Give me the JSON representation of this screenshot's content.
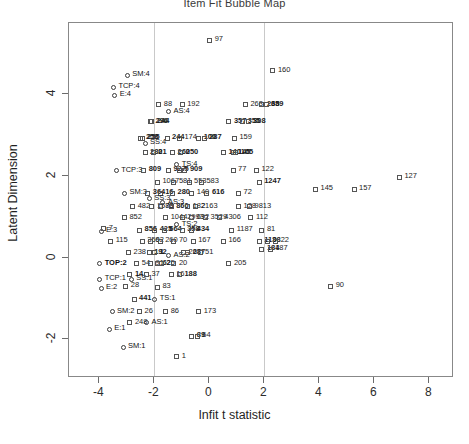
{
  "chart_data": {
    "type": "scatter",
    "title": "Item Fit Bubble Map",
    "xlabel": "Infit t statistic",
    "ylabel": "Latent Dimension",
    "footnote": "",
    "xlim": [
      -5.1,
      8.9
    ],
    "ylim": [
      -2.95,
      5.75
    ],
    "xticks": [
      -4,
      -2,
      0,
      2,
      4,
      6,
      8
    ],
    "yticks": [
      -2,
      0,
      2,
      4
    ],
    "grid": false,
    "vlines": [
      -2,
      2
    ],
    "legend": "none",
    "point_color": "#555555",
    "vline_color": "#c9c9c9",
    "frame_color": "#888888",
    "points": [
      {
        "label": "97",
        "x": 0.05,
        "y": 5.3,
        "shape": "square"
      },
      {
        "label": "160",
        "x": 2.35,
        "y": 4.55,
        "shape": "square"
      },
      {
        "label": "SM:4",
        "x": -2.95,
        "y": 4.45,
        "shape": "circle",
        "anchor": true
      },
      {
        "label": "TCP:4",
        "x": -3.45,
        "y": 4.15,
        "shape": "circle",
        "anchor": true
      },
      {
        "label": "E:4",
        "x": -3.4,
        "y": 3.95,
        "shape": "circle",
        "anchor": true
      },
      {
        "label": "88",
        "x": -1.8,
        "y": 3.72,
        "shape": "square"
      },
      {
        "label": "192",
        "x": -0.95,
        "y": 3.72,
        "shape": "square"
      },
      {
        "label": "AS:4",
        "x": -1.45,
        "y": 3.55,
        "shape": "circle",
        "anchor": true
      },
      {
        "label": "263",
        "x": 1.35,
        "y": 3.72,
        "shape": "square"
      },
      {
        "label": "268",
        "x": 1.95,
        "y": 3.72,
        "shape": "square",
        "bold": true
      },
      {
        "label": "359",
        "x": 2.1,
        "y": 3.72,
        "shape": "square",
        "bold": true
      },
      {
        "label": "296",
        "x": -2.1,
        "y": 3.3,
        "shape": "square",
        "bold": true
      },
      {
        "label": "244",
        "x": -2.05,
        "y": 3.3,
        "shape": "square",
        "bold": true
      },
      {
        "label": "357",
        "x": 0.75,
        "y": 3.3,
        "shape": "square",
        "bold": true
      },
      {
        "label": "355",
        "x": 1.25,
        "y": 3.3,
        "shape": "square",
        "bold": true
      },
      {
        "label": "308",
        "x": 1.45,
        "y": 3.3,
        "shape": "square",
        "bold": true
      },
      {
        "label": "258",
        "x": -2.45,
        "y": 2.9,
        "shape": "square",
        "bold": true
      },
      {
        "label": "255",
        "x": -2.4,
        "y": 2.9,
        "shape": "square",
        "bold": true
      },
      {
        "label": "SS:4",
        "x": -2.3,
        "y": 2.78,
        "shape": "circle",
        "anchor": true
      },
      {
        "label": "244",
        "x": -1.5,
        "y": 2.9,
        "shape": "square",
        "bold": true
      },
      {
        "label": "174",
        "x": -1.05,
        "y": 2.9,
        "shape": "square"
      },
      {
        "label": "100",
        "x": -0.35,
        "y": 2.9,
        "shape": "square",
        "bold": true
      },
      {
        "label": "287",
        "x": -0.15,
        "y": 2.9,
        "shape": "square",
        "bold": true
      },
      {
        "label": "159",
        "x": 0.95,
        "y": 2.9,
        "shape": "square"
      },
      {
        "label": "280",
        "x": -2.3,
        "y": 2.55,
        "shape": "square",
        "bold": true
      },
      {
        "label": "21",
        "x": -2.0,
        "y": 2.55,
        "shape": "square",
        "bold": true
      },
      {
        "label": "260",
        "x": -1.3,
        "y": 2.55,
        "shape": "square",
        "bold": true
      },
      {
        "label": "250",
        "x": -1.0,
        "y": 2.55,
        "shape": "square",
        "bold": true
      },
      {
        "label": "140",
        "x": 0.55,
        "y": 2.55,
        "shape": "square",
        "bold": true
      },
      {
        "label": "145",
        "x": 0.9,
        "y": 2.55,
        "shape": "square",
        "bold": true
      },
      {
        "label": "165",
        "x": 1.0,
        "y": 2.55,
        "shape": "square",
        "bold": true
      },
      {
        "label": "TCP:3",
        "x": -3.35,
        "y": 2.1,
        "shape": "circle",
        "anchor": true
      },
      {
        "label": "809",
        "x": -2.35,
        "y": 2.12,
        "shape": "square",
        "bold": true
      },
      {
        "label": "927",
        "x": -1.45,
        "y": 2.12,
        "shape": "square",
        "bold": true
      },
      {
        "label": "TS:4",
        "x": -1.15,
        "y": 2.25,
        "shape": "circle",
        "anchor": true
      },
      {
        "label": "5",
        "x": -1.05,
        "y": 2.12,
        "shape": "square",
        "bold": true
      },
      {
        "label": "909",
        "x": -0.85,
        "y": 2.12,
        "shape": "square",
        "bold": true
      },
      {
        "label": "77",
        "x": 0.9,
        "y": 2.12,
        "shape": "square"
      },
      {
        "label": "122",
        "x": 1.75,
        "y": 2.12,
        "shape": "square"
      },
      {
        "label": "1067",
        "x": -1.85,
        "y": 1.82,
        "shape": "square"
      },
      {
        "label": "581",
        "x": -1.25,
        "y": 1.82,
        "shape": "square"
      },
      {
        "label": "553",
        "x": -0.7,
        "y": 1.82,
        "shape": "square"
      },
      {
        "label": "583",
        "x": -0.25,
        "y": 1.82,
        "shape": "square"
      },
      {
        "label": "1247",
        "x": 1.85,
        "y": 1.82,
        "shape": "square",
        "bold": true
      },
      {
        "label": "SM:3",
        "x": -3.05,
        "y": 1.55,
        "shape": "circle",
        "anchor": true
      },
      {
        "label": "364",
        "x": -2.2,
        "y": 1.55,
        "shape": "square",
        "bold": true
      },
      {
        "label": "16",
        "x": -1.75,
        "y": 1.55,
        "shape": "square",
        "bold": true
      },
      {
        "label": "280",
        "x": -1.3,
        "y": 1.55,
        "shape": "square",
        "bold": true
      },
      {
        "label": "140",
        "x": -0.6,
        "y": 1.55,
        "shape": "square"
      },
      {
        "label": "616",
        "x": -0.05,
        "y": 1.55,
        "shape": "square",
        "bold": true
      },
      {
        "label": "72",
        "x": 1.1,
        "y": 1.55,
        "shape": "square"
      },
      {
        "label": "SS:3",
        "x": -2.15,
        "y": 1.42,
        "shape": "circle",
        "anchor": true
      },
      {
        "label": "482",
        "x": -2.75,
        "y": 1.22,
        "shape": "square"
      },
      {
        "label": "1585",
        "x": -2.05,
        "y": 1.22,
        "shape": "square"
      },
      {
        "label": "78",
        "x": -1.75,
        "y": 1.22,
        "shape": "square"
      },
      {
        "label": "AS:3",
        "x": -1.65,
        "y": 1.32,
        "shape": "circle",
        "anchor": true
      },
      {
        "label": "860",
        "x": -1.35,
        "y": 1.22,
        "shape": "square",
        "bold": true
      },
      {
        "label": "182",
        "x": -0.75,
        "y": 1.22,
        "shape": "square"
      },
      {
        "label": "2163",
        "x": -0.45,
        "y": 1.22,
        "shape": "square"
      },
      {
        "label": "128",
        "x": 1.1,
        "y": 1.22,
        "shape": "square"
      },
      {
        "label": "9813",
        "x": 1.5,
        "y": 1.22,
        "shape": "square"
      },
      {
        "label": "852",
        "x": -3.05,
        "y": 0.95,
        "shape": "square"
      },
      {
        "label": "1044",
        "x": -1.55,
        "y": 0.95,
        "shape": "square"
      },
      {
        "label": "2993",
        "x": -0.95,
        "y": 0.95,
        "shape": "square"
      },
      {
        "label": "692",
        "x": -0.6,
        "y": 0.95,
        "shape": "square"
      },
      {
        "label": "3529",
        "x": -0.1,
        "y": 0.95,
        "shape": "square"
      },
      {
        "label": "4306",
        "x": 0.4,
        "y": 0.95,
        "shape": "square"
      },
      {
        "label": "112",
        "x": 1.55,
        "y": 0.95,
        "shape": "square"
      },
      {
        "label": "E:3",
        "x": -3.9,
        "y": 0.62,
        "shape": "circle",
        "anchor": true
      },
      {
        "label": "7",
        "x": -3.8,
        "y": 0.68,
        "shape": "square"
      },
      {
        "label": "856",
        "x": -2.5,
        "y": 0.65,
        "shape": "square",
        "bold": true
      },
      {
        "label": "425",
        "x": -1.95,
        "y": 0.65,
        "shape": "square",
        "bold": true
      },
      {
        "label": "664",
        "x": -1.6,
        "y": 0.65,
        "shape": "square",
        "bold": true
      },
      {
        "label": "TS:2",
        "x": -1.15,
        "y": 0.78,
        "shape": "circle",
        "anchor": true
      },
      {
        "label": "358",
        "x": -0.95,
        "y": 0.65,
        "shape": "square",
        "bold": true
      },
      {
        "label": "434",
        "x": -0.6,
        "y": 0.65,
        "shape": "square",
        "bold": true
      },
      {
        "label": "1187",
        "x": 0.85,
        "y": 0.65,
        "shape": "square"
      },
      {
        "label": "81",
        "x": 1.95,
        "y": 0.65,
        "shape": "square"
      },
      {
        "label": "115",
        "x": -3.55,
        "y": 0.38,
        "shape": "square"
      },
      {
        "label": "359",
        "x": -2.4,
        "y": 0.38,
        "shape": "square"
      },
      {
        "label": "62",
        "x": -2.1,
        "y": 0.38,
        "shape": "square"
      },
      {
        "label": "260",
        "x": -1.75,
        "y": 0.38,
        "shape": "square"
      },
      {
        "label": "70",
        "x": -1.25,
        "y": 0.38,
        "shape": "square"
      },
      {
        "label": "167",
        "x": -0.55,
        "y": 0.38,
        "shape": "square"
      },
      {
        "label": "166",
        "x": 0.55,
        "y": 0.38,
        "shape": "square"
      },
      {
        "label": "113",
        "x": 1.85,
        "y": 0.38,
        "shape": "square",
        "bold": true
      },
      {
        "label": "98",
        "x": 2.15,
        "y": 0.38,
        "shape": "square",
        "bold": true
      },
      {
        "label": "22",
        "x": 2.45,
        "y": 0.38,
        "shape": "square"
      },
      {
        "label": "184",
        "x": 1.95,
        "y": 0.18,
        "shape": "square",
        "bold": true
      },
      {
        "label": "187",
        "x": 2.25,
        "y": 0.18,
        "shape": "square"
      },
      {
        "label": "238",
        "x": -2.9,
        "y": 0.1,
        "shape": "square"
      },
      {
        "label": "192",
        "x": -2.15,
        "y": 0.1,
        "shape": "square",
        "bold": true
      },
      {
        "label": "1",
        "x": -1.95,
        "y": 0.1,
        "shape": "square",
        "bold": true
      },
      {
        "label": "AS:2",
        "x": -1.45,
        "y": 0.02,
        "shape": "circle",
        "anchor": true
      },
      {
        "label": "267",
        "x": -0.9,
        "y": 0.1,
        "shape": "square"
      },
      {
        "label": "287",
        "x": -0.75,
        "y": 0.1,
        "shape": "square",
        "bold": true
      },
      {
        "label": "51",
        "x": -0.3,
        "y": 0.1,
        "shape": "square"
      },
      {
        "label": "TOP:2",
        "x": -3.95,
        "y": -0.18,
        "shape": "circle",
        "anchor": true,
        "bold": true
      },
      {
        "label": "54",
        "x": -2.6,
        "y": -0.18,
        "shape": "square"
      },
      {
        "label": "91",
        "x": -2.1,
        "y": -0.18,
        "shape": "square"
      },
      {
        "label": "62",
        "x": -1.85,
        "y": -0.18,
        "shape": "square",
        "bold": true
      },
      {
        "label": "25",
        "x": -1.7,
        "y": -0.18,
        "shape": "square"
      },
      {
        "label": "20",
        "x": -1.25,
        "y": -0.18,
        "shape": "square"
      },
      {
        "label": "205",
        "x": 0.75,
        "y": -0.18,
        "shape": "square"
      },
      {
        "label": "TCP:1",
        "x": -3.95,
        "y": -0.55,
        "shape": "circle",
        "anchor": true
      },
      {
        "label": "14",
        "x": -2.85,
        "y": -0.45,
        "shape": "square",
        "bold": true
      },
      {
        "label": "SS:1",
        "x": -2.8,
        "y": -0.55,
        "shape": "circle",
        "anchor": true
      },
      {
        "label": "37",
        "x": -2.25,
        "y": -0.45,
        "shape": "square"
      },
      {
        "label": "16",
        "x": -1.35,
        "y": -0.45,
        "shape": "square"
      },
      {
        "label": "188",
        "x": -1.05,
        "y": -0.45,
        "shape": "square",
        "bold": true
      },
      {
        "label": "E:2",
        "x": -3.9,
        "y": -0.78,
        "shape": "circle",
        "anchor": true
      },
      {
        "label": "28",
        "x": -3.0,
        "y": -0.72,
        "shape": "square"
      },
      {
        "label": "83",
        "x": -1.85,
        "y": -0.75,
        "shape": "square"
      },
      {
        "label": "441",
        "x": -2.7,
        "y": -1.05,
        "shape": "square",
        "bold": true
      },
      {
        "label": "TS:1",
        "x": -1.95,
        "y": -1.05,
        "shape": "circle",
        "anchor": true
      },
      {
        "label": "SM:2",
        "x": -3.5,
        "y": -1.35,
        "shape": "circle",
        "anchor": true
      },
      {
        "label": "26",
        "x": -2.5,
        "y": -1.35,
        "shape": "square"
      },
      {
        "label": "86",
        "x": -1.55,
        "y": -1.35,
        "shape": "square"
      },
      {
        "label": "173",
        "x": -0.35,
        "y": -1.35,
        "shape": "square"
      },
      {
        "label": "248",
        "x": -2.85,
        "y": -1.62,
        "shape": "square"
      },
      {
        "label": "AS:1",
        "x": -2.25,
        "y": -1.62,
        "shape": "circle",
        "anchor": true
      },
      {
        "label": "E:1",
        "x": -3.6,
        "y": -1.78,
        "shape": "circle",
        "anchor": true
      },
      {
        "label": "89",
        "x": -0.6,
        "y": -1.95,
        "shape": "square",
        "bold": true
      },
      {
        "label": "64",
        "x": -0.4,
        "y": -1.95,
        "shape": "square"
      },
      {
        "label": "SM:1",
        "x": -3.1,
        "y": -2.22,
        "shape": "circle",
        "anchor": true
      },
      {
        "label": "1",
        "x": -1.15,
        "y": -2.45,
        "shape": "square"
      },
      {
        "label": "145",
        "x": 3.9,
        "y": 1.65,
        "shape": "square"
      },
      {
        "label": "157",
        "x": 5.3,
        "y": 1.65,
        "shape": "square"
      },
      {
        "label": "127",
        "x": 6.95,
        "y": 1.95,
        "shape": "square"
      },
      {
        "label": "90",
        "x": 4.45,
        "y": -0.72,
        "shape": "square"
      }
    ]
  }
}
